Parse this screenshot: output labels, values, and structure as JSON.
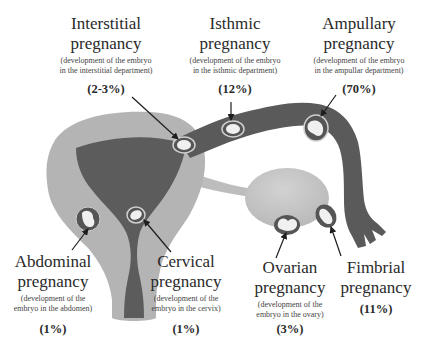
{
  "colors": {
    "background": "#ffffff",
    "outer_uterus": "#b4b4b4",
    "inner_cavity": "#5c5c5c",
    "tube": "#5a5a5a",
    "ligament": "#bdbdbd",
    "ovary": "#c8c8c8",
    "embryo_ring": "#e0e0e0",
    "embryo": "#f0f0f0",
    "arrow": "#1e1e1e",
    "text": "#2a2a2a"
  },
  "labels": {
    "interstitial": {
      "title_line1": "Interstitial",
      "title_line2": "pregnancy",
      "desc_line1": "(development of the embryo",
      "desc_line2": "in the interstitial department)",
      "percent": "(2-3%)"
    },
    "isthmic": {
      "title_line1": "Isthmic",
      "title_line2": "pregnancy",
      "desc_line1": "(development of the embryo",
      "desc_line2": "in the isthmic department)",
      "percent": "(12%)"
    },
    "ampullary": {
      "title_line1": "Ampullary",
      "title_line2": "pregnancy",
      "desc_line1": "(development of the embryo",
      "desc_line2": "in the ampullar department)",
      "percent": "(70%)"
    },
    "abdominal": {
      "title_line1": "Abdominal",
      "title_line2": "pregnancy",
      "desc_line1": "(development of the",
      "desc_line2": "embryo in the abdomen)",
      "percent": "(1%)"
    },
    "cervical": {
      "title_line1": "Cervical",
      "title_line2": "pregnancy",
      "desc_line1": "(development of the",
      "desc_line2": "embryo in the cervix)",
      "percent": "(1%)"
    },
    "ovarian": {
      "title_line1": "Ovarian",
      "title_line2": "pregnancy",
      "desc_line1": "(development of the",
      "desc_line2": "embryo in the ovary)",
      "percent": "(3%)"
    },
    "fimbrial": {
      "title_line1": "Fimbrial",
      "title_line2": "pregnancy",
      "percent": "(11%)"
    }
  }
}
